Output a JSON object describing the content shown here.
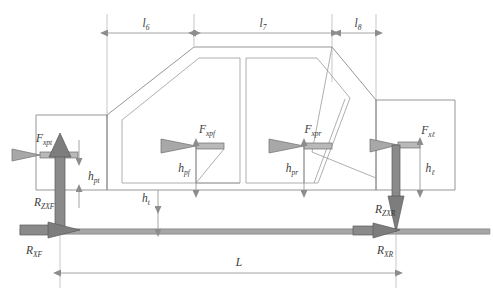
{
  "figure": {
    "type": "engineering-free-body-diagram"
  },
  "dimensions": {
    "l6": {
      "label": "l",
      "sub": "6"
    },
    "l7": {
      "label": "l",
      "sub": "7"
    },
    "l8": {
      "label": "l",
      "sub": "8"
    },
    "L": {
      "label": "L",
      "sub": ""
    }
  },
  "heights": {
    "h_pt": {
      "label": "h",
      "sub": "pt"
    },
    "h_pf": {
      "label": "h",
      "sub": "pf"
    },
    "h_pr": {
      "label": "h",
      "sub": "pr"
    },
    "h_l": {
      "label": "h",
      "sub": "ℓ"
    },
    "h_t": {
      "label": "h",
      "sub": "t"
    }
  },
  "forces": {
    "F_xpt": {
      "label": "F",
      "sub": "xpt"
    },
    "F_xpf": {
      "label": "F",
      "sub": "xpf"
    },
    "F_xpr": {
      "label": "F",
      "sub": "xpr"
    },
    "F_xl": {
      "label": "F",
      "sub": "xℓ"
    }
  },
  "reactions": {
    "R_ZXF": {
      "label": "R",
      "sub": "ZXF"
    },
    "R_XF": {
      "label": "R",
      "sub": "XF"
    },
    "R_ZXR": {
      "label": "R",
      "sub": "ZXR"
    },
    "R_XR": {
      "label": "R",
      "sub": "XR"
    }
  },
  "colors": {
    "outline": "#8a8a8a",
    "dimension": "#8d8d8d",
    "arrow_light": "#b9b9b9",
    "arrow_dark": "#8a8a8a",
    "text": "#3a3a3a",
    "background": "#ffffff"
  }
}
